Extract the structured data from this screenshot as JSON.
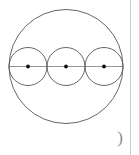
{
  "canvas": {
    "width": 139,
    "height": 155,
    "background_color": "#ffffff"
  },
  "annotations": {
    "paren_label": ")",
    "paren_color": "#8d8d8d"
  },
  "rule": {
    "color": "#cfcfcf"
  },
  "figure": {
    "title": "Three congruent circles inscribed along the diameter of a larger circle",
    "stroke_color": "#555555",
    "diameter_color": "#888888",
    "dot_color": "#111111",
    "stroke_width": 0.9,
    "large_circle": {
      "name": "outer-circle",
      "cx": 66,
      "cy": 66.5,
      "r": 57
    },
    "diameter_line": {
      "name": "horizontal-diameter",
      "x1": 9,
      "y1": 66.5,
      "x2": 123,
      "y2": 66.5
    },
    "small_circles": [
      {
        "name": "inner-circle-left",
        "cx": 28,
        "cy": 66.5,
        "r": 19
      },
      {
        "name": "inner-circle-middle",
        "cx": 66,
        "cy": 66.5,
        "r": 19
      },
      {
        "name": "inner-circle-right",
        "cx": 104,
        "cy": 66.5,
        "r": 19
      }
    ],
    "center_dots": [
      {
        "name": "center-dot-left",
        "cx": 28,
        "cy": 66.5,
        "r": 1.9
      },
      {
        "name": "center-dot-middle",
        "cx": 66,
        "cy": 66.5,
        "r": 1.9
      },
      {
        "name": "center-dot-right",
        "cx": 104,
        "cy": 66.5,
        "r": 1.9
      }
    ]
  }
}
